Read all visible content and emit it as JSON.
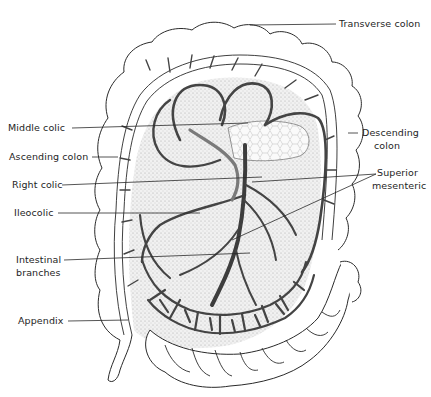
{
  "figure": {
    "colors": {
      "background": "#ffffff",
      "outline": "#2a2a2a",
      "artery": "#4a4a4a",
      "artery_light": "#7a7a7a",
      "stipple": "#d9d9d9",
      "label": "#1e1e1e"
    }
  },
  "labels": {
    "transverse_colon": "Transverse colon",
    "middle_colic": "Middle colic",
    "ascending_colon": "Ascending colon",
    "descending_colon_1": "Descending",
    "descending_colon_2": "colon",
    "right_colic": "Right colic",
    "superior_mesenteric_1": "Superior",
    "superior_mesenteric_2": "mesenteric",
    "ileocolic": "Ileocolic",
    "intestinal_branches_1": "Intestinal",
    "intestinal_branches_2": "branches",
    "appendix": "Appendix"
  }
}
